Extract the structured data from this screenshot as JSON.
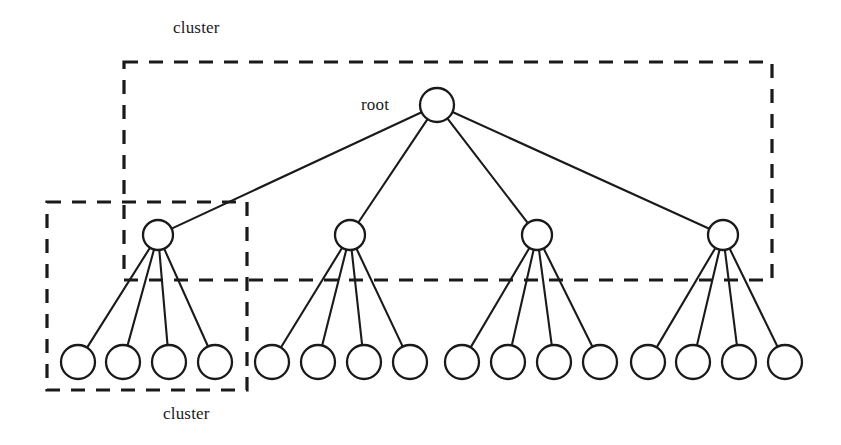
{
  "figure": {
    "type": "tree-diagram",
    "background_color": "#ffffff",
    "stroke_color": "#1a1a1a",
    "width": 841,
    "height": 445
  },
  "labels": {
    "cluster_top": "cluster",
    "cluster_bottom": "cluster",
    "root": "root"
  },
  "tree": {
    "root": {
      "id": "root",
      "cx": 437,
      "cy": 105,
      "r": 17
    },
    "internal": [
      {
        "id": "internal-1",
        "cx": 158,
        "cy": 235,
        "r": 15
      },
      {
        "id": "internal-2",
        "cx": 350,
        "cy": 235,
        "r": 15
      },
      {
        "id": "internal-3",
        "cx": 537,
        "cy": 235,
        "r": 15
      },
      {
        "id": "internal-4",
        "cx": 723,
        "cy": 235,
        "r": 15
      }
    ],
    "leaves": [
      {
        "id": "leaf-1",
        "cx": 78,
        "cy": 362,
        "r": 17,
        "parent": "internal-1"
      },
      {
        "id": "leaf-2",
        "cx": 123,
        "cy": 362,
        "r": 17,
        "parent": "internal-1"
      },
      {
        "id": "leaf-3",
        "cx": 169,
        "cy": 362,
        "r": 17,
        "parent": "internal-1"
      },
      {
        "id": "leaf-4",
        "cx": 215,
        "cy": 362,
        "r": 17,
        "parent": "internal-1"
      },
      {
        "id": "leaf-5",
        "cx": 272,
        "cy": 362,
        "r": 17,
        "parent": "internal-2"
      },
      {
        "id": "leaf-6",
        "cx": 318,
        "cy": 362,
        "r": 17,
        "parent": "internal-2"
      },
      {
        "id": "leaf-7",
        "cx": 364,
        "cy": 362,
        "r": 17,
        "parent": "internal-2"
      },
      {
        "id": "leaf-8",
        "cx": 410,
        "cy": 362,
        "r": 17,
        "parent": "internal-2"
      },
      {
        "id": "leaf-9",
        "cx": 462,
        "cy": 362,
        "r": 17,
        "parent": "internal-3"
      },
      {
        "id": "leaf-10",
        "cx": 508,
        "cy": 362,
        "r": 17,
        "parent": "internal-3"
      },
      {
        "id": "leaf-11",
        "cx": 554,
        "cy": 362,
        "r": 17,
        "parent": "internal-3"
      },
      {
        "id": "leaf-12",
        "cx": 600,
        "cy": 362,
        "r": 17,
        "parent": "internal-3"
      },
      {
        "id": "leaf-13",
        "cx": 648,
        "cy": 362,
        "r": 17,
        "parent": "internal-4"
      },
      {
        "id": "leaf-14",
        "cx": 693,
        "cy": 362,
        "r": 17,
        "parent": "internal-4"
      },
      {
        "id": "leaf-15",
        "cx": 739,
        "cy": 362,
        "r": 17,
        "parent": "internal-4"
      },
      {
        "id": "leaf-16",
        "cx": 785,
        "cy": 362,
        "r": 17,
        "parent": "internal-4"
      }
    ]
  },
  "cluster_boxes": [
    {
      "id": "cluster-box-top",
      "x": 124,
      "y": 62,
      "width": 648,
      "height": 218
    },
    {
      "id": "cluster-box-bottom",
      "x": 47,
      "y": 202,
      "width": 200,
      "height": 188
    }
  ]
}
